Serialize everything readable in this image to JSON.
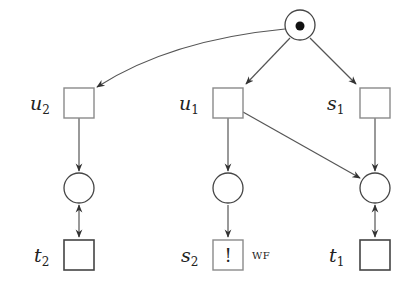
{
  "diagram": {
    "type": "petri-net",
    "colors": {
      "stroke": "#555555",
      "box_stroke": "#8a8a8a",
      "token": "#111111",
      "background": "#ffffff"
    },
    "places": [
      {
        "id": "p0",
        "marked": true
      },
      {
        "id": "p_left",
        "marked": false
      },
      {
        "id": "p_mid",
        "marked": false
      },
      {
        "id": "p_right",
        "marked": false
      }
    ],
    "transitions": [
      {
        "id": "u2",
        "label": "u",
        "sub": "2"
      },
      {
        "id": "u1",
        "label": "u",
        "sub": "1"
      },
      {
        "id": "s1",
        "label": "s",
        "sub": "1"
      },
      {
        "id": "t2",
        "label": "t",
        "sub": "2"
      },
      {
        "id": "s2",
        "label": "s",
        "sub": "2",
        "mark": "!",
        "annotation": "WF"
      },
      {
        "id": "t1",
        "label": "t",
        "sub": "1"
      }
    ],
    "arcs": [
      "p0 -> u2",
      "p0 -> u1",
      "p0 -> s1",
      "u2 -> p_left",
      "u1 -> p_mid",
      "u1 -> p_right",
      "s1 -> p_right",
      "p_left <-> t2",
      "p_mid -> s2",
      "p_right <-> t1"
    ]
  }
}
